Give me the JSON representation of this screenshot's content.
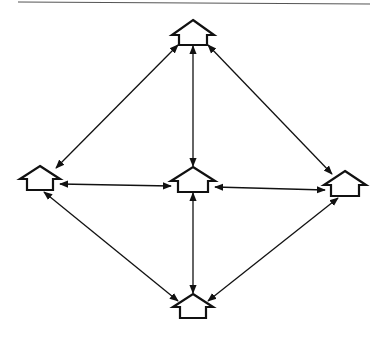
{
  "diagram": {
    "type": "network",
    "colors": {
      "stroke": "#111111",
      "rule": "#555555",
      "background": "#ffffff"
    },
    "top_rule": {
      "x1": 18,
      "y1": 2,
      "x2": 370,
      "y2": 4
    },
    "nodes": [
      {
        "id": "top",
        "cx": 193,
        "peak_y": 20,
        "eave_y": 35,
        "base_y": 45,
        "half_roof": 21,
        "half_wall": 14
      },
      {
        "id": "left",
        "cx": 40,
        "peak_y": 166,
        "eave_y": 179,
        "base_y": 190,
        "half_roof": 20,
        "half_wall": 13
      },
      {
        "id": "center",
        "cx": 193,
        "peak_y": 167,
        "eave_y": 181,
        "base_y": 192,
        "half_roof": 22,
        "half_wall": 15
      },
      {
        "id": "right",
        "cx": 345,
        "peak_y": 171,
        "eave_y": 185,
        "base_y": 196,
        "half_roof": 21,
        "half_wall": 14
      },
      {
        "id": "bottom",
        "cx": 193,
        "peak_y": 294,
        "eave_y": 307,
        "base_y": 318,
        "half_roof": 20,
        "half_wall": 13
      }
    ],
    "edges": [
      {
        "from": "top",
        "to": "left",
        "x1": 178,
        "y1": 45,
        "x2": 56,
        "y2": 168
      },
      {
        "from": "top",
        "to": "center",
        "x1": 193,
        "y1": 46,
        "x2": 193,
        "y2": 166
      },
      {
        "from": "top",
        "to": "right",
        "x1": 208,
        "y1": 45,
        "x2": 332,
        "y2": 174
      },
      {
        "from": "left",
        "to": "center",
        "x1": 60,
        "y1": 184,
        "x2": 171,
        "y2": 186
      },
      {
        "from": "center",
        "to": "right",
        "x1": 215,
        "y1": 187,
        "x2": 325,
        "y2": 190
      },
      {
        "from": "left",
        "to": "bottom",
        "x1": 44,
        "y1": 192,
        "x2": 178,
        "y2": 301
      },
      {
        "from": "center",
        "to": "bottom",
        "x1": 193,
        "y1": 193,
        "x2": 193,
        "y2": 293
      },
      {
        "from": "right",
        "to": "bottom",
        "x1": 338,
        "y1": 198,
        "x2": 208,
        "y2": 301
      }
    ]
  }
}
